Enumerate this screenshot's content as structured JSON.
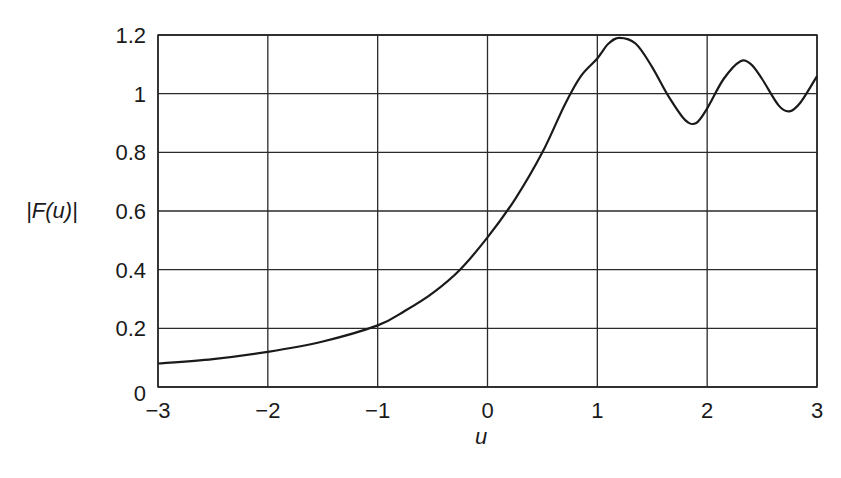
{
  "chart_data": {
    "type": "line",
    "title": "",
    "xlabel": "u",
    "ylabel": "|F(u)|",
    "xlim": [
      -3,
      3
    ],
    "ylim": [
      0,
      1.2
    ],
    "grid": true,
    "legend": null,
    "x_ticks": [
      "−3",
      "−2",
      "−1",
      "0",
      "1",
      "2",
      "3"
    ],
    "y_ticks": [
      "0",
      "0.2",
      "0.4",
      "0.6",
      "0.8",
      "1",
      "1.2"
    ],
    "series": [
      {
        "name": "|F(u)|",
        "x": [
          -3,
          -2.5,
          -2,
          -1.5,
          -1,
          -0.75,
          -0.5,
          -0.25,
          0,
          0.25,
          0.5,
          0.7,
          0.85,
          1.0,
          1.1,
          1.2,
          1.35,
          1.5,
          1.65,
          1.8,
          1.9,
          2.0,
          2.15,
          2.3,
          2.4,
          2.5,
          2.65,
          2.75,
          2.85,
          3.0
        ],
        "values": [
          0.08,
          0.095,
          0.12,
          0.155,
          0.21,
          0.26,
          0.32,
          0.4,
          0.51,
          0.64,
          0.8,
          0.96,
          1.06,
          1.12,
          1.17,
          1.19,
          1.17,
          1.09,
          0.99,
          0.91,
          0.9,
          0.95,
          1.05,
          1.11,
          1.1,
          1.05,
          0.96,
          0.94,
          0.97,
          1.06
        ]
      }
    ]
  }
}
